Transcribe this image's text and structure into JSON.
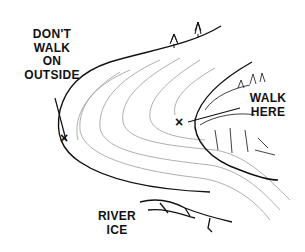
{
  "diagram": {
    "labels": {
      "outside": [
        "DON'T",
        "WALK",
        "ON",
        "OUTSIDE"
      ],
      "inside": [
        "WALK",
        "HERE"
      ],
      "ice": [
        "RIVER",
        "ICE"
      ]
    },
    "markers": {
      "outside_x": "×",
      "inside_x": "×"
    },
    "colors": {
      "ink": "#111111",
      "ice_lines": "#9a9a9a",
      "background": "#ffffff"
    }
  }
}
